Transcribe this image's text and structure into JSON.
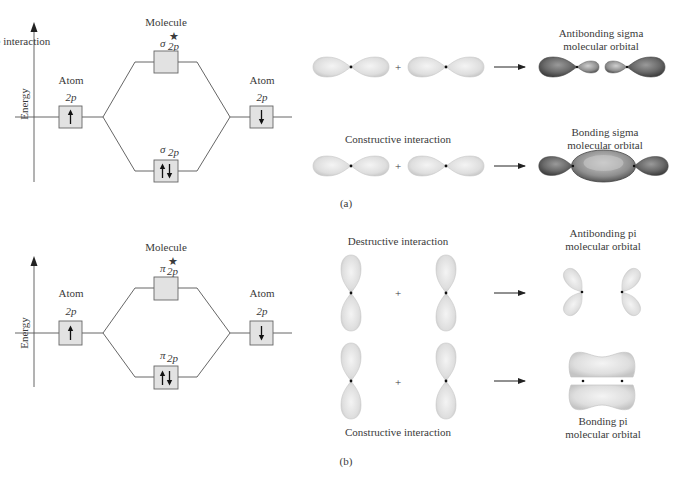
{
  "panels": [
    {
      "id": "a",
      "caption": "(a)",
      "energy_diagram": {
        "axis_label": "Energy",
        "molecule_label": "Molecule",
        "left_atom": {
          "label": "Atom",
          "orbital": "2p",
          "electrons": "up"
        },
        "right_atom": {
          "label": "Atom",
          "orbital": "2p",
          "electrons": "down"
        },
        "antibonding": {
          "symbol": "σ",
          "sub": "2p",
          "sup": "★",
          "electrons": "none"
        },
        "bonding": {
          "symbol": "σ",
          "sub": "2p",
          "electrons": "up-down"
        }
      },
      "interactions": [
        {
          "label": "Destructive interaction",
          "plus": "+",
          "result_label_1": "Antibonding sigma",
          "result_label_2": "molecular orbital"
        },
        {
          "label": "Constructive interaction",
          "plus": "+",
          "result_label_1": "Bonding sigma",
          "result_label_2": "molecular orbital"
        }
      ]
    },
    {
      "id": "b",
      "caption": "(b)",
      "energy_diagram": {
        "axis_label": "Energy",
        "molecule_label": "Molecule",
        "left_atom": {
          "label": "Atom",
          "orbital": "2p",
          "electrons": "up"
        },
        "right_atom": {
          "label": "Atom",
          "orbital": "2p",
          "electrons": "down"
        },
        "antibonding": {
          "symbol": "π",
          "sub": "2p",
          "sup": "★",
          "electrons": "none"
        },
        "bonding": {
          "symbol": "π",
          "sub": "2p",
          "electrons": "up-down"
        }
      },
      "interactions": [
        {
          "label": "Destructive interaction",
          "plus": "+",
          "result_label_1": "Antibonding pi",
          "result_label_2": "molecular orbital"
        },
        {
          "label": "Constructive interaction",
          "plus": "+",
          "result_label_1": "Bonding pi",
          "result_label_2": "molecular orbital"
        }
      ]
    }
  ],
  "colors": {
    "lobe_light": "#dcdcdc",
    "lobe_dark": "#5a5a5a",
    "box_fill": "#e2e2e2",
    "line": "#555555"
  }
}
